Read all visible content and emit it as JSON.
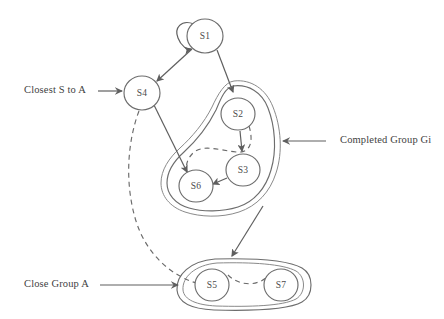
{
  "figure": {
    "background_color": "#ffffff",
    "stroke_color": "#6d6d6d",
    "text_color": "#3f3f3f"
  },
  "nodes": [
    {
      "id": "S1",
      "label": "S1",
      "cx": 205,
      "cy": 36,
      "rx": 18,
      "ry": 17
    },
    {
      "id": "S4",
      "label": "S4",
      "cx": 142,
      "cy": 93,
      "rx": 18,
      "ry": 17
    },
    {
      "id": "S2",
      "label": "S2",
      "cx": 238,
      "cy": 114,
      "rx": 17,
      "ry": 16
    },
    {
      "id": "S3",
      "label": "S3",
      "cx": 243,
      "cy": 170,
      "rx": 17,
      "ry": 16
    },
    {
      "id": "S6",
      "label": "S6",
      "cx": 196,
      "cy": 186,
      "rx": 17,
      "ry": 16
    },
    {
      "id": "S5",
      "label": "S5",
      "cx": 212,
      "cy": 285,
      "rx": 17,
      "ry": 16
    },
    {
      "id": "S7",
      "label": "S7",
      "cx": 281,
      "cy": 285,
      "rx": 17,
      "ry": 16
    }
  ],
  "edges": [
    {
      "name": "self-loop-s1",
      "from": "S1",
      "to": "S1",
      "style": "solid",
      "arrow": true
    },
    {
      "name": "s1-to-s4",
      "from": "S1",
      "to": "S4",
      "style": "solid",
      "arrow": true
    },
    {
      "name": "s1-to-s2",
      "from": "S1",
      "to": "S2",
      "style": "solid",
      "arrow": true
    },
    {
      "name": "s4-to-s6",
      "from": "S4",
      "to": "S6",
      "style": "solid",
      "arrow": true
    },
    {
      "name": "s2-to-s3",
      "from": "S2",
      "to": "S3",
      "style": "solid",
      "arrow": true
    },
    {
      "name": "s3-to-s6",
      "from": "S3",
      "to": "S6",
      "style": "solid",
      "arrow": true
    },
    {
      "name": "group-gi-to-group-a",
      "from": "Completed Group Gi",
      "to": "Close Group A",
      "style": "solid",
      "arrow": true
    },
    {
      "name": "s2-to-s6-dashed",
      "from": "S2",
      "to": "S6",
      "style": "dashed",
      "arrow": false
    },
    {
      "name": "s4-to-s5-dashed",
      "from": "S4",
      "to": "S5",
      "style": "dashed",
      "arrow": false
    },
    {
      "name": "s5-to-s7-dashed",
      "from": "S5",
      "to": "S7",
      "style": "dashed",
      "arrow": false
    }
  ],
  "groups": [
    {
      "name": "completed-group-gi",
      "label": "Completed Group Gi",
      "members": [
        "S2",
        "S3",
        "S6"
      ],
      "shape": "irregular-blob"
    },
    {
      "name": "close-group-a",
      "label": "Close Group A",
      "members": [
        "S5",
        "S7"
      ],
      "shape": "stadium"
    }
  ],
  "annotations": [
    {
      "name": "closest-s-to-a",
      "text": "Closest S to A",
      "x": 24,
      "y": 91,
      "points_to": "S4",
      "arrow_direction": "right"
    },
    {
      "name": "completed-group-gi",
      "text": "Completed Group Gi",
      "x": 340,
      "y": 141,
      "points_to": "completed-group-gi",
      "arrow_direction": "left"
    },
    {
      "name": "close-group-a",
      "text": "Close Group A",
      "x": 24,
      "y": 285,
      "points_to": "close-group-a",
      "arrow_direction": "right"
    }
  ]
}
